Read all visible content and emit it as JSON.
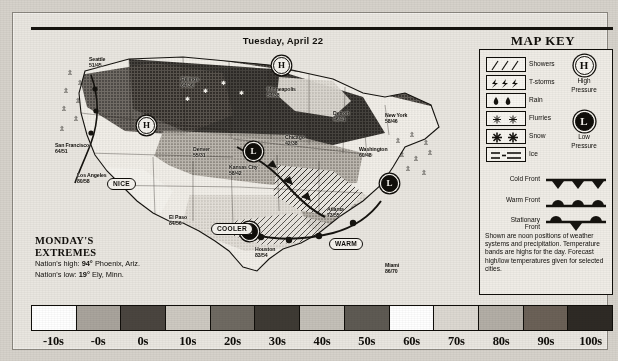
{
  "header": {
    "date": "Tuesday, April 22"
  },
  "map_key": {
    "title": "MAP KEY",
    "precip_symbols": [
      {
        "name": "showers",
        "label": "Showers"
      },
      {
        "name": "tstorms",
        "label": "T-storms"
      },
      {
        "name": "rain",
        "label": "Rain"
      },
      {
        "name": "flurries",
        "label": "Flurries"
      },
      {
        "name": "snow",
        "label": "Snow"
      },
      {
        "name": "ice",
        "label": "Ice"
      }
    ],
    "pressure": [
      {
        "glyph": "H",
        "line1": "High",
        "line2": "Pressure"
      },
      {
        "glyph": "L",
        "line1": "Low",
        "line2": "Pressure"
      }
    ],
    "fronts": [
      {
        "name": "cold-front",
        "line1": "Cold Front",
        "line2": ""
      },
      {
        "name": "warm-front",
        "line1": "Warm Front",
        "line2": ""
      },
      {
        "name": "stationary-front",
        "line1": "Stationary",
        "line2": "Front"
      }
    ],
    "note": "Shown are noon positions of weather systems and precipitation. Temperature bands are highs for the day. Forecast high/low temperatures given for selected cities."
  },
  "extremes": {
    "title_line1": "MONDAY'S",
    "title_line2": "EXTREMES",
    "high_label": "Nation's high:",
    "high_value": "94°",
    "high_place": "Phoenix, Ariz.",
    "low_label": "Nation's low:",
    "low_value": "19°",
    "low_place": "Ely, Minn."
  },
  "map": {
    "cities": [
      {
        "name": "Seattle",
        "label": "Seattle",
        "temps": "51/45",
        "x": 56,
        "y": 22
      },
      {
        "name": "Billings",
        "label": "Billings",
        "temps": "64/36",
        "x": 148,
        "y": 42
      },
      {
        "name": "Minneapolis",
        "label": "Minneapolis",
        "temps": "54/38",
        "x": 234,
        "y": 52
      },
      {
        "name": "Detroit",
        "label": "Detroit",
        "temps": "46/41",
        "x": 300,
        "y": 76
      },
      {
        "name": "New York",
        "label": "New York",
        "temps": "58/46",
        "x": 352,
        "y": 78
      },
      {
        "name": "San Francisco",
        "label": "San Francisco",
        "temps": "64/51",
        "x": 22,
        "y": 108
      },
      {
        "name": "Denver",
        "label": "Denver",
        "temps": "55/31",
        "x": 160,
        "y": 112
      },
      {
        "name": "Chicago",
        "label": "Chicago",
        "temps": "42/38",
        "x": 252,
        "y": 100
      },
      {
        "name": "Washington",
        "label": "Washington",
        "temps": "60/48",
        "x": 326,
        "y": 112
      },
      {
        "name": "Kansas City",
        "label": "Kansas City",
        "temps": "58/42",
        "x": 196,
        "y": 130
      },
      {
        "name": "Los Angeles",
        "label": "Los Angeles",
        "temps": "80/58",
        "x": 44,
        "y": 138
      },
      {
        "name": "El Paso",
        "label": "El Paso",
        "temps": "84/56",
        "x": 136,
        "y": 180
      },
      {
        "name": "Atlanta",
        "label": "Atlanta",
        "temps": "73/55",
        "x": 294,
        "y": 172
      },
      {
        "name": "Houston",
        "label": "Houston",
        "temps": "83/54",
        "x": 222,
        "y": 212
      },
      {
        "name": "Miami",
        "label": "Miami",
        "temps": "86/70",
        "x": 352,
        "y": 228
      }
    ],
    "pressure_markers": [
      {
        "glyph": "H",
        "x": 240,
        "y": 22
      },
      {
        "glyph": "H",
        "x": 105,
        "y": 82
      },
      {
        "glyph": "L",
        "x": 212,
        "y": 108
      },
      {
        "glyph": "L",
        "x": 348,
        "y": 140
      },
      {
        "glyph": "L",
        "x": 208,
        "y": 188
      }
    ],
    "callouts": [
      {
        "text": "NICE",
        "x": 74,
        "y": 143
      },
      {
        "text": "COOLER",
        "x": 178,
        "y": 188
      },
      {
        "text": "WARM",
        "x": 296,
        "y": 203
      }
    ]
  },
  "temperature_scale": {
    "labels": [
      "-10s",
      "-0s",
      "0s",
      "10s",
      "20s",
      "30s",
      "40s",
      "50s",
      "60s",
      "70s",
      "80s",
      "90s",
      "100s"
    ],
    "band_fills": [
      "#ffffff",
      "#a9a49c",
      "#4a453f",
      "#cdc9c1",
      "#6f6a62",
      "#3e3a34",
      "#c4c0b8",
      "#5e5a53",
      "#ffffff",
      "#dcd8d1",
      "#b3aea6",
      "#6b6157",
      "#2e2a25"
    ]
  }
}
